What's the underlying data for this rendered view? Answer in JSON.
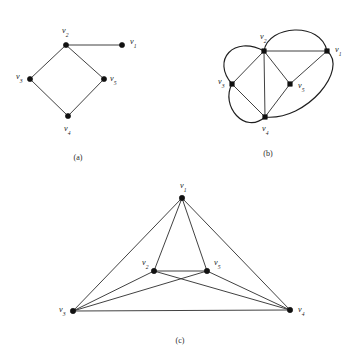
{
  "figure": {
    "background_color": "#ffffff",
    "edge_color": "#2b2b2b",
    "vertex_color": "#111111",
    "label_color": "#1a1a1a",
    "width": 360,
    "height": 358
  },
  "vertex_labels": {
    "v1": {
      "base": "v",
      "sub": "1",
      "text": "v1"
    },
    "v2": {
      "base": "v",
      "sub": "2",
      "text": "v2"
    },
    "v3": {
      "base": "v",
      "sub": "3",
      "text": "v3"
    },
    "v4": {
      "base": "v",
      "sub": "4",
      "text": "v4"
    },
    "v5": {
      "base": "v",
      "sub": "5",
      "text": "v5"
    }
  },
  "panels": [
    {
      "id": "a",
      "caption": "(a)",
      "caption_pos": {
        "x": 78,
        "y": 160
      },
      "vertices": [
        {
          "id": "v1",
          "x": 122,
          "y": 45,
          "label_x": 130,
          "label_y": 44,
          "label_base": "v",
          "label_sub": "1"
        },
        {
          "id": "v2",
          "x": 66,
          "y": 45,
          "label_x": 62,
          "label_y": 33,
          "label_base": "v",
          "label_sub": "2"
        },
        {
          "id": "v3",
          "x": 30,
          "y": 79,
          "label_x": 16,
          "label_y": 79,
          "label_base": "v",
          "label_sub": "3"
        },
        {
          "id": "v4",
          "x": 68,
          "y": 116,
          "label_x": 64,
          "label_y": 131,
          "label_base": "v",
          "label_sub": "4"
        },
        {
          "id": "v5",
          "x": 104,
          "y": 79,
          "label_x": 110,
          "label_y": 81,
          "label_base": "v",
          "label_sub": "5"
        }
      ],
      "edges": [
        {
          "from": "v2",
          "to": "v1",
          "type": "line"
        },
        {
          "from": "v2",
          "to": "v3",
          "type": "line"
        },
        {
          "from": "v2",
          "to": "v5",
          "type": "line"
        },
        {
          "from": "v3",
          "to": "v4",
          "type": "line"
        },
        {
          "from": "v5",
          "to": "v4",
          "type": "line"
        }
      ]
    },
    {
      "id": "b",
      "caption": "(b)",
      "caption_pos": {
        "x": 268,
        "y": 156
      },
      "vertices": [
        {
          "id": "v1",
          "x": 327,
          "y": 51,
          "label_x": 335,
          "label_y": 52,
          "label_base": "v",
          "label_sub": "1"
        },
        {
          "id": "v2",
          "x": 264,
          "y": 51,
          "label_x": 260,
          "label_y": 39,
          "label_base": "v",
          "label_sub": "2"
        },
        {
          "id": "v3",
          "x": 232,
          "y": 84,
          "label_x": 218,
          "label_y": 84,
          "label_base": "v",
          "label_sub": "3"
        },
        {
          "id": "v4",
          "x": 265,
          "y": 117,
          "label_x": 262,
          "label_y": 131,
          "label_base": "v",
          "label_sub": "4"
        },
        {
          "id": "v5",
          "x": 290,
          "y": 84,
          "label_x": 298,
          "label_y": 88,
          "label_base": "v",
          "label_sub": "5"
        }
      ],
      "edges": [
        {
          "from": "v2",
          "to": "v1",
          "type": "line"
        },
        {
          "from": "v2",
          "to": "v3",
          "type": "line"
        },
        {
          "from": "v2",
          "to": "v4",
          "type": "line"
        },
        {
          "from": "v2",
          "to": "v5",
          "type": "line"
        },
        {
          "from": "v3",
          "to": "v4",
          "type": "line"
        },
        {
          "from": "v4",
          "to": "v5",
          "type": "line"
        },
        {
          "from": "v5",
          "to": "v1",
          "type": "line"
        },
        {
          "from": "v2",
          "to": "v3",
          "type": "curve-left-outer"
        },
        {
          "from": "v2",
          "to": "v1",
          "type": "curve-top-outer"
        },
        {
          "from": "v1",
          "to": "v4",
          "type": "curve-right-outer"
        },
        {
          "from": "v3",
          "to": "v4",
          "type": "curve-bottom-left-outer"
        }
      ]
    },
    {
      "id": "c",
      "caption": "(c)",
      "caption_pos": {
        "x": 180,
        "y": 343
      },
      "vertices": [
        {
          "id": "v1",
          "x": 182,
          "y": 198,
          "label_x": 180,
          "label_y": 188,
          "label_base": "v",
          "label_sub": "1"
        },
        {
          "id": "v2",
          "x": 154,
          "y": 271,
          "label_x": 142,
          "label_y": 265,
          "label_base": "v",
          "label_sub": "2"
        },
        {
          "id": "v3",
          "x": 73,
          "y": 311,
          "label_x": 59,
          "label_y": 312,
          "label_base": "v",
          "label_sub": "3"
        },
        {
          "id": "v4",
          "x": 290,
          "y": 310,
          "label_x": 298,
          "label_y": 312,
          "label_base": "v",
          "label_sub": "4"
        },
        {
          "id": "v5",
          "x": 207,
          "y": 271,
          "label_x": 214,
          "label_y": 265,
          "label_base": "v",
          "label_sub": "5"
        }
      ],
      "edges": [
        {
          "from": "v1",
          "to": "v3",
          "type": "line"
        },
        {
          "from": "v1",
          "to": "v2",
          "type": "line"
        },
        {
          "from": "v1",
          "to": "v5",
          "type": "line"
        },
        {
          "from": "v1",
          "to": "v4",
          "type": "line"
        },
        {
          "from": "v2",
          "to": "v5",
          "type": "line"
        },
        {
          "from": "v2",
          "to": "v3",
          "type": "line"
        },
        {
          "from": "v2",
          "to": "v4",
          "type": "line"
        },
        {
          "from": "v5",
          "to": "v3",
          "type": "line"
        },
        {
          "from": "v5",
          "to": "v4",
          "type": "line"
        },
        {
          "from": "v3",
          "to": "v4",
          "type": "line"
        }
      ]
    }
  ]
}
